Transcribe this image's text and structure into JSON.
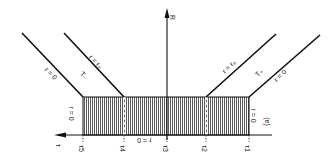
{
  "diagram": {
    "axes": {
      "vertical_label": "R",
      "horizontal_label": "τ"
    },
    "tick_labels": [
      "τ5",
      "τ4",
      "τ3",
      "τ2",
      "τ1"
    ],
    "region_labels": {
      "left_boundary": "r = 0",
      "right_boundary": "r = 0",
      "center": "r = 0",
      "panel": "(e)"
    },
    "line_labels": {
      "left_outer": "r = 0",
      "left_inner": "r = r₀",
      "left_region": "T₋",
      "right_inner": "r = r₀",
      "right_outer": "r = 0",
      "right_region": "T₊"
    },
    "colors": {
      "line": "#111111",
      "hatch": "#555555",
      "background": "#ffffff"
    }
  }
}
